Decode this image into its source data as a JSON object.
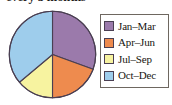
{
  "title": "every 3 months",
  "colors": {
    "jan_mar": "#9b7aab",
    "apr_jun": "#ee8b4e",
    "jul_sep": "#f7f3a0",
    "oct_dec": "#9ecdec",
    "outline": "#4a3f52",
    "legend_border": "#6e6760",
    "background": "#ffffff",
    "text": "#17150f"
  },
  "legend": {
    "items": [
      {
        "label": "Jan–Mar",
        "color": "#9b7aab",
        "swatch_name": "swatch-jan-mar"
      },
      {
        "label": "Apr–Jun",
        "color": "#ee8b4e",
        "swatch_name": "swatch-apr-jun"
      },
      {
        "label": "Jul–Sep",
        "color": "#f7f3a0",
        "swatch_name": "swatch-jul-sep"
      },
      {
        "label": "Oct–Dec",
        "color": "#9ecdec",
        "swatch_name": "swatch-oct-dec"
      }
    ]
  },
  "chart_data": {
    "type": "pie",
    "title": "every 3 months",
    "xlabel": "",
    "ylabel": "",
    "grid": false,
    "legend_position": "right",
    "start_angle_deg": 0,
    "direction": "clockwise",
    "categories": [
      "Jan–Mar",
      "Apr–Jun",
      "Jul–Sep",
      "Oct–Dec"
    ],
    "values": [
      30.6,
      19.4,
      13.9,
      36.1
    ],
    "units": "percent",
    "slice_angles_deg": [
      110,
      70,
      50,
      130
    ],
    "colors": [
      "#9b7aab",
      "#ee8b4e",
      "#f7f3a0",
      "#9ecdec"
    ],
    "slices": [
      {
        "label": "Jan–Mar",
        "value": 30.6,
        "angle_deg": 110,
        "start_deg": 0,
        "end_deg": 110,
        "color": "#9b7aab"
      },
      {
        "label": "Apr–Jun",
        "value": 19.4,
        "angle_deg": 70,
        "start_deg": 110,
        "end_deg": 180,
        "color": "#ee8b4e"
      },
      {
        "label": "Jul–Sep",
        "value": 13.9,
        "angle_deg": 50,
        "start_deg": 180,
        "end_deg": 230,
        "color": "#f7f3a0"
      },
      {
        "label": "Oct–Dec",
        "value": 36.1,
        "angle_deg": 130,
        "start_deg": 230,
        "end_deg": 360,
        "color": "#9ecdec"
      }
    ]
  }
}
